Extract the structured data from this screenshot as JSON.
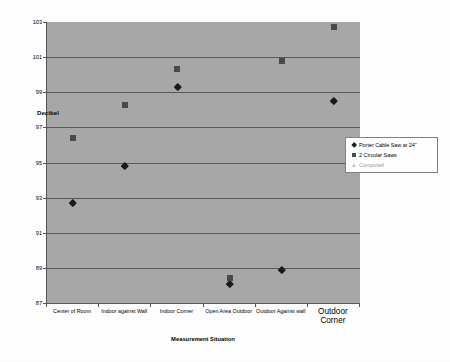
{
  "chart_data": {
    "type": "scatter",
    "title": "",
    "xlabel": "Measurement Situation",
    "ylabel": "Decibel",
    "ylim": [
      87,
      103
    ],
    "yticks": [
      87,
      89,
      91,
      93,
      95,
      97,
      99,
      101,
      103
    ],
    "grid": true,
    "legend_position": "right",
    "categories": [
      "Center of Room",
      "Indoor against Wall",
      "Indoor Corner",
      "Open Area Outdoor",
      "Outdoor Against wall",
      "Outdoor Corner"
    ],
    "series": [
      {
        "name": "Porter Cable Saw at 24\"",
        "marker": "diamond",
        "color": "#1a1a1a",
        "values": [
          92.7,
          94.8,
          99.3,
          88.1,
          88.9,
          98.5
        ]
      },
      {
        "name": "2 Circular Saws",
        "marker": "square",
        "color": "#4a4a4a",
        "values": [
          96.4,
          98.3,
          100.3,
          88.4,
          100.8,
          102.7
        ]
      },
      {
        "name": "Computed",
        "marker": "triangle",
        "color": "#cfcfcf",
        "values": [
          null,
          null,
          null,
          null,
          null,
          null
        ]
      }
    ]
  },
  "axis": {
    "y_label_inline": "Decibel",
    "x_title": "Measurement Situation",
    "y_ticks": [
      "103",
      "101",
      "99",
      "97",
      "95",
      "93",
      "91",
      "89",
      "87"
    ],
    "x_ticks": [
      {
        "label": "Center of Room",
        "emphasis": false
      },
      {
        "label": "Indoor against Wall",
        "emphasis": false
      },
      {
        "label": "Indoor Corner",
        "emphasis": false
      },
      {
        "label": "Open Area Outdoor",
        "emphasis": false
      },
      {
        "label": "Outdoor Against wall",
        "emphasis": false
      },
      {
        "label": "Outdoor Corner",
        "emphasis": true
      }
    ]
  },
  "legend": {
    "items": [
      {
        "label": "Porter Cable Saw at 24\"",
        "marker": "diamond"
      },
      {
        "label": "2 Circular Saws",
        "marker": "square"
      },
      {
        "label": "Computed",
        "marker": "triangle"
      }
    ]
  },
  "colors": {
    "plot_background": "#a8a8a8",
    "gridline": "#5a5a5a",
    "series_1": "#1a1a1a",
    "series_2": "#4a4a4a",
    "series_3": "#cfcfcf",
    "page_background": "#ffffff"
  }
}
